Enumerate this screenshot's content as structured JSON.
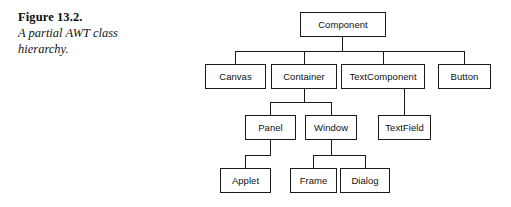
{
  "caption": {
    "figure_label": "Figure 13.2.",
    "description": "A partial AWT class hierarchy."
  },
  "diagram": {
    "line_color": "#1a1a1a",
    "box_fill": "#ffffff",
    "nodes": [
      {
        "id": "component",
        "label": "Component",
        "x": 300,
        "y": 12,
        "w": 86,
        "h": 25
      },
      {
        "id": "canvas",
        "label": "Canvas",
        "x": 205,
        "y": 64,
        "w": 61,
        "h": 25
      },
      {
        "id": "container",
        "label": "Container",
        "x": 271,
        "y": 64,
        "w": 66,
        "h": 25
      },
      {
        "id": "textcomponent",
        "label": "TextComponent",
        "x": 341,
        "y": 64,
        "w": 84,
        "h": 25
      },
      {
        "id": "button",
        "label": "Button",
        "x": 438,
        "y": 64,
        "w": 53,
        "h": 25
      },
      {
        "id": "panel",
        "label": "Panel",
        "x": 245,
        "y": 115,
        "w": 51,
        "h": 25
      },
      {
        "id": "window",
        "label": "Window",
        "x": 305,
        "y": 115,
        "w": 52,
        "h": 25
      },
      {
        "id": "textfield",
        "label": "TextField",
        "x": 378,
        "y": 115,
        "w": 53,
        "h": 25
      },
      {
        "id": "applet",
        "label": "Applet",
        "x": 220,
        "y": 168,
        "w": 51,
        "h": 25
      },
      {
        "id": "frame",
        "label": "Frame",
        "x": 290,
        "y": 168,
        "w": 47,
        "h": 25
      },
      {
        "id": "dialog",
        "label": "Dialog",
        "x": 340,
        "y": 168,
        "w": 50,
        "h": 25
      }
    ],
    "edges": [
      {
        "id": "component-stub",
        "from": "component",
        "to": "bus-row2",
        "type": "v",
        "x": 342,
        "y": 37,
        "len": 15
      },
      {
        "id": "bus-row2",
        "from": "component",
        "to": "row2",
        "type": "h",
        "x": 235,
        "y": 51,
        "len": 229
      },
      {
        "id": "drop-canvas",
        "from": "bus-row2",
        "to": "canvas",
        "type": "v",
        "x": 235,
        "y": 51,
        "len": 13
      },
      {
        "id": "drop-container",
        "from": "bus-row2",
        "to": "container",
        "type": "v",
        "x": 304,
        "y": 51,
        "len": 13
      },
      {
        "id": "drop-textcomponent",
        "from": "bus-row2",
        "to": "textcomponent",
        "type": "v",
        "x": 383,
        "y": 51,
        "len": 13
      },
      {
        "id": "drop-button",
        "from": "bus-row2",
        "to": "button",
        "type": "v",
        "x": 464,
        "y": 51,
        "len": 13
      },
      {
        "id": "container-stub",
        "from": "container",
        "to": "bus-row3",
        "type": "v",
        "x": 304,
        "y": 89,
        "len": 13
      },
      {
        "id": "bus-row3",
        "from": "container",
        "to": "row3",
        "type": "h",
        "x": 270,
        "y": 102,
        "len": 62
      },
      {
        "id": "drop-panel",
        "from": "bus-row3",
        "to": "panel",
        "type": "v",
        "x": 270,
        "y": 102,
        "len": 13
      },
      {
        "id": "drop-window",
        "from": "bus-row3",
        "to": "window",
        "type": "v",
        "x": 331,
        "y": 102,
        "len": 13
      },
      {
        "id": "textcomponent-to-textfield",
        "from": "textcomponent",
        "to": "textfield",
        "type": "v",
        "x": 404,
        "y": 89,
        "len": 26
      },
      {
        "id": "panel-stub",
        "from": "panel",
        "to": "jog-applet",
        "type": "v",
        "x": 270,
        "y": 140,
        "len": 15
      },
      {
        "id": "jog-applet",
        "from": "panel",
        "to": "applet",
        "type": "h",
        "x": 245,
        "y": 155,
        "len": 26
      },
      {
        "id": "drop-applet",
        "from": "jog-applet",
        "to": "applet",
        "type": "v",
        "x": 245,
        "y": 155,
        "len": 13
      },
      {
        "id": "window-stub",
        "from": "window",
        "to": "bus-row4",
        "type": "v",
        "x": 331,
        "y": 140,
        "len": 15
      },
      {
        "id": "bus-row4",
        "from": "window",
        "to": "row4",
        "type": "h",
        "x": 313,
        "y": 155,
        "len": 53
      },
      {
        "id": "drop-frame",
        "from": "bus-row4",
        "to": "frame",
        "type": "v",
        "x": 313,
        "y": 155,
        "len": 13
      },
      {
        "id": "drop-dialog",
        "from": "bus-row4",
        "to": "dialog",
        "type": "v",
        "x": 365,
        "y": 155,
        "len": 13
      }
    ]
  }
}
